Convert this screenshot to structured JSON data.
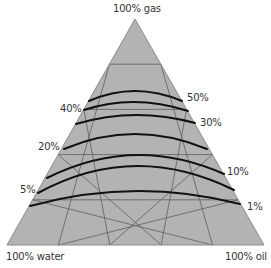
{
  "diagram": {
    "type": "ternary",
    "vertices": {
      "top": {
        "label": "100% gas",
        "x": 135,
        "y": 19
      },
      "left": {
        "label": "100% water",
        "x": 7,
        "y": 245
      },
      "right": {
        "label": "100% oil",
        "x": 264,
        "y": 245
      }
    },
    "grid_divisions": 5,
    "colors": {
      "fill": "#b3b3b3",
      "grid": "#5e5e5e",
      "edge": "#8a8a8a",
      "curve": "#111111",
      "text": "#333333"
    },
    "curves": [
      {
        "value": "50%",
        "points": [
          [
            89,
            101
          ],
          [
            135,
            91
          ],
          [
            182,
            101
          ]
        ],
        "label_side": "right",
        "label_x": 187,
        "label_y": 93
      },
      {
        "value": "40%",
        "points": [
          [
            84,
            110
          ],
          [
            135,
            102
          ],
          [
            188,
            111
          ]
        ],
        "label_side": "left",
        "label_x": 60,
        "label_y": 104
      },
      {
        "value": "30%",
        "points": [
          [
            76,
            124
          ],
          [
            135,
            115
          ],
          [
            195,
            123
          ]
        ],
        "label_side": "right",
        "label_x": 200,
        "label_y": 118
      },
      {
        "value": "20%",
        "points": [
          [
            64,
            149
          ],
          [
            135,
            134
          ],
          [
            207,
            149
          ]
        ],
        "label_side": "left",
        "label_x": 38,
        "label_y": 142
      },
      {
        "value": "10%",
        "points": [
          [
            47,
            178
          ],
          [
            135,
            155
          ],
          [
            224,
            174
          ]
        ],
        "label_side": "right",
        "label_x": 227,
        "label_y": 167
      },
      {
        "value": "5%",
        "points": [
          [
            38,
            193
          ],
          [
            135,
            166
          ],
          [
            234,
            190
          ]
        ],
        "label_side": "left",
        "label_x": 20,
        "label_y": 185
      },
      {
        "value": "1%",
        "points": [
          [
            30,
            206
          ],
          [
            135,
            191
          ],
          [
            240,
            204
          ]
        ],
        "label_side": "right",
        "label_x": 247,
        "label_y": 202
      }
    ]
  },
  "labels": {
    "top": "100% gas",
    "bottom_left": "100% water",
    "bottom_right": "100% oil",
    "curve_50": "50%",
    "curve_40": "40%",
    "curve_30": "30%",
    "curve_20": "20%",
    "curve_10": "10%",
    "curve_5": "5%",
    "curve_1": "1%"
  }
}
